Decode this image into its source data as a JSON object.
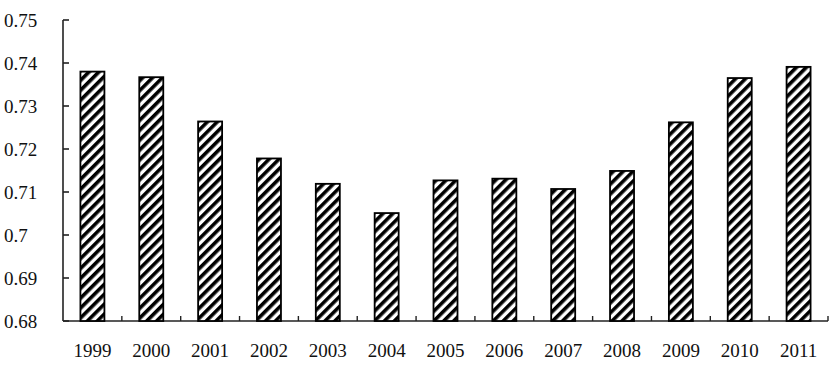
{
  "chart_data": {
    "type": "bar",
    "title": "",
    "xlabel": "",
    "ylabel": "",
    "categories": [
      "1999",
      "2000",
      "2001",
      "2002",
      "2003",
      "2004",
      "2005",
      "2006",
      "2007",
      "2008",
      "2009",
      "2010",
      "2011"
    ],
    "values": [
      0.738,
      0.7367,
      0.7264,
      0.7178,
      0.7119,
      0.7051,
      0.7127,
      0.7131,
      0.7107,
      0.7149,
      0.7262,
      0.7365,
      0.7391
    ],
    "ylim": [
      0.68,
      0.75
    ],
    "yticks": [
      "0.68",
      "0.69",
      "0.7",
      "0.71",
      "0.72",
      "0.73",
      "0.74",
      "0.75"
    ],
    "grid": false,
    "legend": null,
    "bar_style": "diagonal-hatch",
    "colors": {
      "bar_stroke": "#000000",
      "hatch": "#000000",
      "background": "#ffffff",
      "axis": "#222222"
    }
  }
}
